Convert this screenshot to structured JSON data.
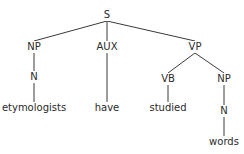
{
  "tree": {
    "title": "Syntax tree",
    "nodes": {
      "s": {
        "label": "S",
        "x": 107,
        "y": 15
      },
      "np1": {
        "label": "NP",
        "x": 34,
        "y": 47
      },
      "aux": {
        "label": "AUX",
        "x": 107,
        "y": 47
      },
      "vp": {
        "label": "VP",
        "x": 195,
        "y": 47
      },
      "n1": {
        "label": "N",
        "x": 34,
        "y": 77
      },
      "vb": {
        "label": "VB",
        "x": 168,
        "y": 79
      },
      "np2": {
        "label": "NP",
        "x": 224,
        "y": 79
      },
      "w1": {
        "label": "etymologists",
        "x": 34,
        "y": 108
      },
      "w2": {
        "label": "have",
        "x": 107,
        "y": 108
      },
      "w3": {
        "label": "studied",
        "x": 168,
        "y": 108
      },
      "n2": {
        "label": "N",
        "x": 224,
        "y": 111
      },
      "w4": {
        "label": "words",
        "x": 224,
        "y": 142
      }
    },
    "edges": [
      [
        "s",
        "np1"
      ],
      [
        "s",
        "aux"
      ],
      [
        "s",
        "vp"
      ],
      [
        "np1",
        "n1"
      ],
      [
        "n1",
        "w1"
      ],
      [
        "aux",
        "w2"
      ],
      [
        "vp",
        "vb"
      ],
      [
        "vp",
        "np2"
      ],
      [
        "vb",
        "w3"
      ],
      [
        "np2",
        "n2"
      ],
      [
        "n2",
        "w4"
      ]
    ]
  }
}
